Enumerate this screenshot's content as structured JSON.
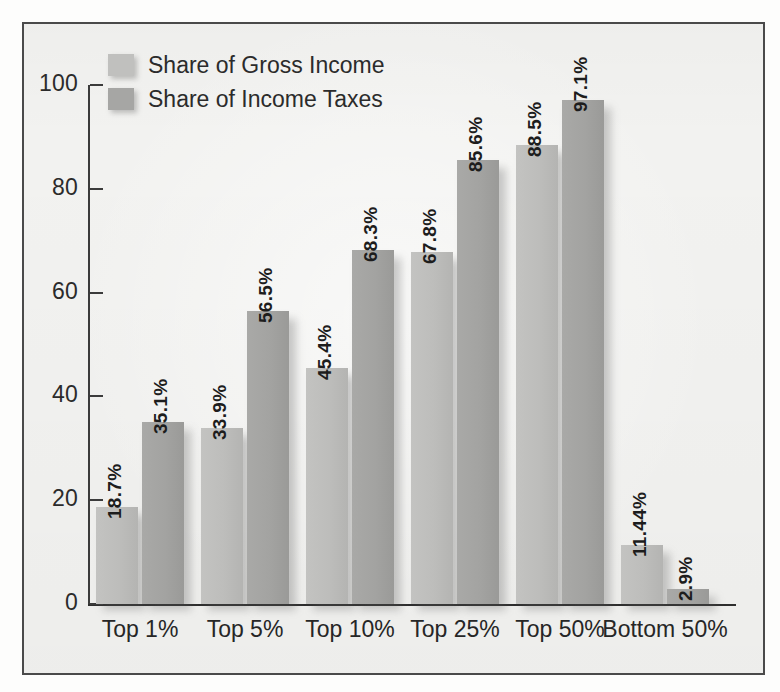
{
  "figure": {
    "background_color": "#f2f2f0",
    "frame_color": "#4a4a4a"
  },
  "legend": {
    "position": "top-left-inside",
    "items": [
      {
        "label": "Share of Gross Income",
        "color": "#c0c0be",
        "key": "income"
      },
      {
        "label": "Share of Income Taxes",
        "color": "#a6a6a4",
        "key": "taxes"
      }
    ]
  },
  "axes": {
    "y_ticks": [
      "0",
      "20",
      "40",
      "60",
      "80",
      "100"
    ],
    "y_tick_values": [
      0,
      20,
      40,
      60,
      80,
      100
    ],
    "x_labels": [
      "Top 1%",
      "Top 5%",
      "Top 10%",
      "Top 25%",
      "Top 50%",
      "Bottom 50%"
    ]
  },
  "chart_data": {
    "type": "bar",
    "title": "",
    "subtitle": "",
    "xlabel": "",
    "ylabel": "",
    "ylim": [
      0,
      100
    ],
    "grid": false,
    "legend_position": "upper left",
    "categories": [
      "Top 1%",
      "Top 5%",
      "Top 10%",
      "Top 25%",
      "Top 50%",
      "Bottom 50%"
    ],
    "series": [
      {
        "name": "Share of Gross Income",
        "color": "#c0c0be",
        "values": [
          18.7,
          33.9,
          45.4,
          67.8,
          88.5,
          11.44
        ],
        "labels": [
          "18.7%",
          "33.9%",
          "45.4%",
          "67.8%",
          "88.5%",
          "11.44%"
        ]
      },
      {
        "name": "Share of Income Taxes",
        "color": "#a6a6a4",
        "values": [
          35.1,
          56.5,
          68.3,
          85.6,
          97.1,
          2.9
        ],
        "labels": [
          "35.1%",
          "56.5%",
          "68.3%",
          "85.6%",
          "97.1%",
          "2.9%"
        ]
      }
    ]
  }
}
